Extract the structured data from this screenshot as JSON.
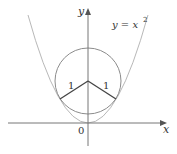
{
  "diagram": {
    "axes": {
      "x_label": "x",
      "y_label": "y",
      "origin_label": "0"
    },
    "curve": {
      "label": "y = x",
      "exponent": "2",
      "color": "#b0b0b0"
    },
    "circle": {
      "color": "#888888"
    },
    "radii": {
      "left_label": "1",
      "right_label": "1",
      "color": "#444444"
    }
  }
}
